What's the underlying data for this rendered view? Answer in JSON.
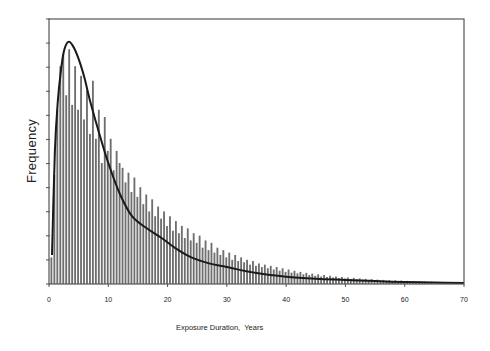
{
  "chart_data": {
    "type": "bar",
    "title": "",
    "xlabel": "Exposure Duration,  Years",
    "ylabel": "Frequency",
    "xlim": [
      0,
      70
    ],
    "ylim": [
      0,
      1.095
    ],
    "x_ticks": [
      0,
      10,
      20,
      30,
      40,
      50,
      60,
      70
    ],
    "y_ticks_labeled": false,
    "y_tick_count": 11,
    "grid": false,
    "legend": null,
    "bin_width": 0.5,
    "series": [
      {
        "name": "Histogram",
        "type": "bar",
        "bin_start": 0.5,
        "values": [
          0.11,
          0.45,
          0.72,
          0.9,
          0.95,
          0.78,
          0.97,
          0.74,
          0.9,
          0.72,
          0.86,
          0.68,
          0.8,
          0.62,
          0.84,
          0.6,
          0.72,
          0.5,
          0.69,
          0.55,
          0.6,
          0.47,
          0.55,
          0.5,
          0.48,
          0.42,
          0.46,
          0.38,
          0.44,
          0.36,
          0.4,
          0.33,
          0.37,
          0.3,
          0.35,
          0.28,
          0.32,
          0.27,
          0.3,
          0.24,
          0.28,
          0.22,
          0.26,
          0.21,
          0.24,
          0.19,
          0.23,
          0.18,
          0.21,
          0.17,
          0.2,
          0.15,
          0.18,
          0.14,
          0.17,
          0.13,
          0.15,
          0.12,
          0.14,
          0.11,
          0.13,
          0.1,
          0.12,
          0.095,
          0.11,
          0.09,
          0.1,
          0.08,
          0.095,
          0.075,
          0.085,
          0.07,
          0.08,
          0.065,
          0.075,
          0.06,
          0.07,
          0.055,
          0.065,
          0.05,
          0.06,
          0.047,
          0.055,
          0.044,
          0.05,
          0.04,
          0.046,
          0.037,
          0.043,
          0.034,
          0.04,
          0.031,
          0.037,
          0.029,
          0.034,
          0.027,
          0.031,
          0.025,
          0.029,
          0.023,
          0.027,
          0.021,
          0.025,
          0.02,
          0.023,
          0.018,
          0.021,
          0.017,
          0.02,
          0.016,
          0.018,
          0.015,
          0.017,
          0.014,
          0.016,
          0.013,
          0.015,
          0.012,
          0.014,
          0.011,
          0.013,
          0.01,
          0.012,
          0.01,
          0.011,
          0.009,
          0.01,
          0.008,
          0.009,
          0.008,
          0.008,
          0.007,
          0.007,
          0.006,
          0.006,
          0.005,
          0.005,
          0.005,
          0.004
        ]
      },
      {
        "name": "Fitted distribution",
        "type": "line",
        "x": [
          0.5,
          1,
          1.5,
          2,
          2.5,
          3.2,
          4,
          5,
          6,
          7,
          8.5,
          10,
          12,
          14,
          16.5,
          19,
          21.5,
          24,
          27,
          30,
          35,
          40,
          45,
          50,
          55,
          60,
          65,
          70
        ],
        "values": [
          0.12,
          0.55,
          0.76,
          0.88,
          0.96,
          1.0,
          0.985,
          0.93,
          0.85,
          0.75,
          0.62,
          0.5,
          0.37,
          0.28,
          0.23,
          0.19,
          0.145,
          0.11,
          0.085,
          0.07,
          0.045,
          0.03,
          0.022,
          0.017,
          0.012,
          0.008,
          0.006,
          0.004
        ]
      }
    ],
    "annotations": []
  },
  "labels": {
    "x_axis_title": "Exposure Duration,  Years",
    "y_axis_title": "Frequency",
    "x_ticks": [
      "0",
      "10",
      "20",
      "30",
      "40",
      "50",
      "60",
      "70"
    ]
  },
  "colors": {
    "axis": "#555555",
    "bar": "#6e6e6e",
    "curve": "#1a1a1a",
    "background": "#ffffff"
  }
}
